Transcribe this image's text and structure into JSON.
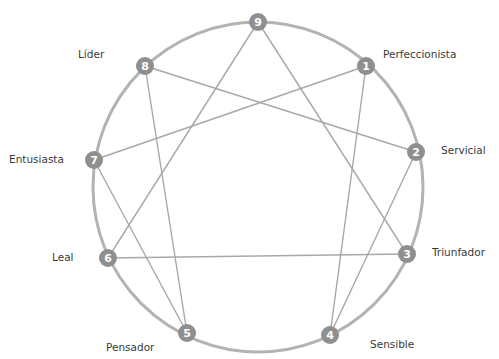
{
  "diagram": {
    "colors": {
      "circle": "#b3b3b3",
      "lines": "#a8a8a8",
      "node_fill": "#8f8f8f",
      "node_text": "#ffffff",
      "label_text": "#3a3a3a"
    },
    "circle": {
      "cx": 258,
      "cy": 187,
      "r": 165
    },
    "nodes": [
      {
        "id": "9",
        "number": "9",
        "label": "",
        "x": 258,
        "y": 22
      },
      {
        "id": "1",
        "number": "1",
        "label": "Perfeccionista",
        "x": 366,
        "y": 66
      },
      {
        "id": "2",
        "number": "2",
        "label": "Servicial",
        "x": 416,
        "y": 152
      },
      {
        "id": "3",
        "number": "3",
        "label": "Triunfador",
        "x": 407,
        "y": 254
      },
      {
        "id": "4",
        "number": "4",
        "label": "Sensible",
        "x": 330,
        "y": 335
      },
      {
        "id": "5",
        "number": "5",
        "label": "Pensador",
        "x": 187,
        "y": 333
      },
      {
        "id": "6",
        "number": "6",
        "label": "Leal",
        "x": 108,
        "y": 258
      },
      {
        "id": "7",
        "number": "7",
        "label": "Entusiasta",
        "x": 94,
        "y": 160
      },
      {
        "id": "8",
        "number": "8",
        "label": "Líder",
        "x": 145,
        "y": 66
      }
    ],
    "edges": [
      [
        "9",
        "3"
      ],
      [
        "3",
        "6"
      ],
      [
        "6",
        "9"
      ],
      [
        "1",
        "4"
      ],
      [
        "4",
        "2"
      ],
      [
        "2",
        "8"
      ],
      [
        "8",
        "5"
      ],
      [
        "5",
        "7"
      ],
      [
        "7",
        "1"
      ]
    ],
    "labels": [
      {
        "text": "Líder",
        "x": 78,
        "y": 48
      },
      {
        "text": "Perfeccionista",
        "x": 383,
        "y": 48
      },
      {
        "text": "Entusiasta",
        "x": 9,
        "y": 153
      },
      {
        "text": "Servicial",
        "x": 441,
        "y": 144
      },
      {
        "text": "Leal",
        "x": 52,
        "y": 251
      },
      {
        "text": "Triunfador",
        "x": 432,
        "y": 246
      },
      {
        "text": "Pensador",
        "x": 106,
        "y": 341
      },
      {
        "text": "Sensible",
        "x": 370,
        "y": 338
      }
    ]
  }
}
